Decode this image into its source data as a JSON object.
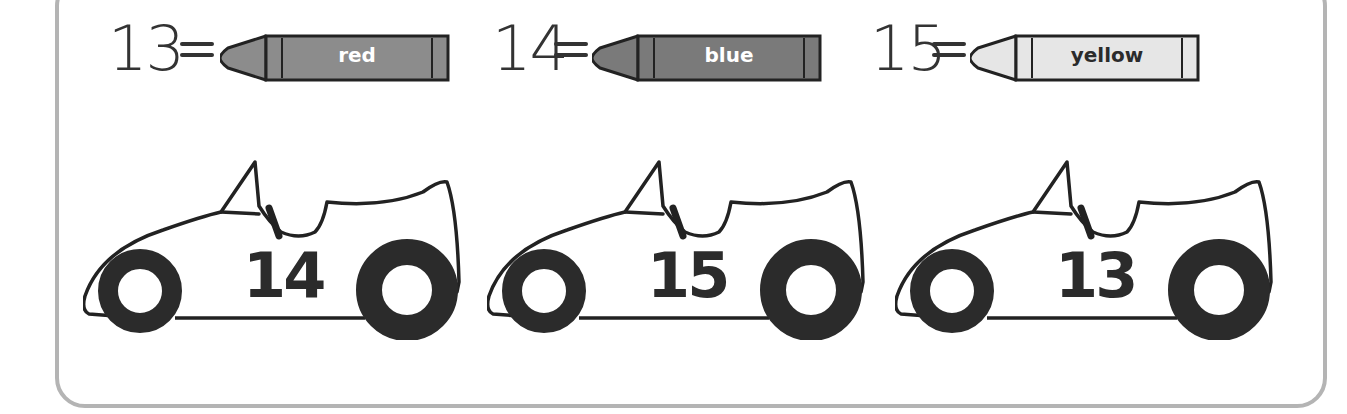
{
  "worksheet": {
    "type": "color-by-number",
    "key": [
      {
        "number": "13",
        "equals": "=",
        "color_label": "red",
        "crayon_fill": "#8c8c8c",
        "label_color": "#ffffff"
      },
      {
        "number": "14",
        "equals": "=",
        "color_label": "blue",
        "crayon_fill": "#7a7a7a",
        "label_color": "#ffffff"
      },
      {
        "number": "15",
        "equals": "=",
        "color_label": "yellow",
        "crayon_fill": "#e6e6e6",
        "label_color": "#2b2b2b"
      }
    ],
    "cars": [
      {
        "number": "14"
      },
      {
        "number": "15"
      },
      {
        "number": "13"
      }
    ],
    "colors": {
      "frame_border": "#b4b4b4",
      "outline": "#222222",
      "tire": "#2b2b2b"
    }
  }
}
